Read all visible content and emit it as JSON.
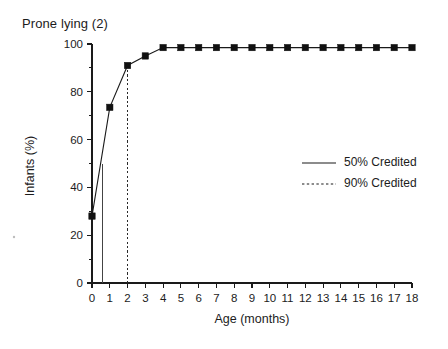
{
  "chart_data": {
    "type": "line",
    "title": "Prone lying (2)",
    "xlabel": "Age (months)",
    "ylabel": "Infants (%)",
    "xlim": [
      0,
      18
    ],
    "ylim": [
      0,
      100
    ],
    "grid": false,
    "x": [
      0,
      1,
      2,
      3,
      4,
      5,
      6,
      7,
      8,
      9,
      10,
      11,
      12,
      13,
      14,
      15,
      16,
      17,
      18
    ],
    "series": [
      {
        "name": "50% Credited",
        "style": "solid",
        "marker": "filled-square",
        "values": [
          28,
          73.5,
          91,
          95,
          98.5,
          98.5,
          98.5,
          98.5,
          98.5,
          98.5,
          98.5,
          98.5,
          98.5,
          98.5,
          98.5,
          98.5,
          98.5,
          98.5,
          98.5
        ]
      }
    ],
    "reference_lines": [
      {
        "name": "50% Credited",
        "orientation": "vertical",
        "x": 0.6,
        "style": "solid"
      },
      {
        "name": "90% Credited",
        "orientation": "vertical",
        "x": 2.0,
        "style": "dashed"
      }
    ],
    "x_ticks": [
      "0",
      "1",
      "2",
      "3",
      "4",
      "5",
      "6",
      "7",
      "8",
      "9",
      "10",
      "11",
      "12",
      "13",
      "14",
      "15",
      "16",
      "17",
      "18"
    ],
    "y_ticks_major": [
      "0",
      "20",
      "40",
      "60",
      "80",
      "100"
    ],
    "y_minor_tick_values": [
      10,
      30,
      50,
      70,
      90
    ],
    "legend": {
      "position": "center-right",
      "entries": [
        {
          "label": "50% Credited",
          "style": "solid"
        },
        {
          "label": "90% Credited",
          "style": "dashed"
        }
      ]
    },
    "colors": {
      "line": "#1a1a1a",
      "marker": "#111111",
      "axis": "#1a1a1a",
      "background": "#ffffff"
    }
  }
}
